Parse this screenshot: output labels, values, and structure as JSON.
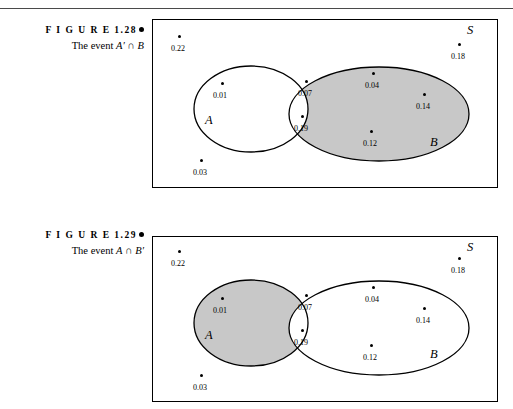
{
  "page": {
    "background_color": "#ffffff",
    "rule_color": "#4a4a4a",
    "shade_color": "#c8c8c8",
    "stroke_color": "#000000"
  },
  "figures": [
    {
      "id": "1.28",
      "caption_label": "F I G U R E  1.28",
      "caption_text_prefix": "The event ",
      "caption_set_1": "A′",
      "caption_operator": " ∩ ",
      "caption_set_2": "B",
      "caption_full": "The event A′ ∩ B",
      "universe_label": "S",
      "set_a_label": "A",
      "set_b_label": "B",
      "shaded_region": "B minus A",
      "points": [
        {
          "value": "0.22",
          "region": "outside"
        },
        {
          "value": "0.18",
          "region": "outside"
        },
        {
          "value": "0.03",
          "region": "outside"
        },
        {
          "value": "0.01",
          "region": "A only"
        },
        {
          "value": "0.07",
          "region": "A and B"
        },
        {
          "value": "0.19",
          "region": "A and B"
        },
        {
          "value": "0.04",
          "region": "B only"
        },
        {
          "value": "0.14",
          "region": "B only"
        },
        {
          "value": "0.12",
          "region": "B only"
        }
      ]
    },
    {
      "id": "1.29",
      "caption_label": "F I G U R E  1.29",
      "caption_text_prefix": "The event ",
      "caption_set_1": "A",
      "caption_operator": " ∩ ",
      "caption_set_2": "B′",
      "caption_full": "The event A ∩ B′",
      "universe_label": "S",
      "set_a_label": "A",
      "set_b_label": "B",
      "shaded_region": "A minus B",
      "points": [
        {
          "value": "0.22",
          "region": "outside"
        },
        {
          "value": "0.18",
          "region": "outside"
        },
        {
          "value": "0.03",
          "region": "outside"
        },
        {
          "value": "0.01",
          "region": "A only"
        },
        {
          "value": "0.07",
          "region": "A and B"
        },
        {
          "value": "0.19",
          "region": "A and B"
        },
        {
          "value": "0.04",
          "region": "B only"
        },
        {
          "value": "0.14",
          "region": "B only"
        },
        {
          "value": "0.12",
          "region": "B only"
        }
      ]
    }
  ]
}
